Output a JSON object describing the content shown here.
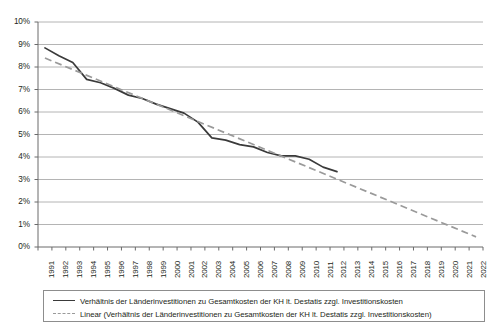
{
  "chart_data": {
    "type": "line",
    "title": "",
    "subtitle": "",
    "xlabel": "",
    "ylabel": "",
    "grid": true,
    "legend_position": "bottom",
    "ylim": [
      0,
      10
    ],
    "ytick_labels": [
      "0%",
      "1%",
      "2%",
      "3%",
      "4%",
      "5%",
      "6%",
      "7%",
      "8%",
      "9%",
      "10%"
    ],
    "ytick_values": [
      0,
      1,
      2,
      3,
      4,
      5,
      6,
      7,
      8,
      9,
      10
    ],
    "categories": [
      "1991",
      "1992",
      "1993",
      "1994",
      "1995",
      "1996",
      "1997",
      "1998",
      "1999",
      "2000",
      "2001",
      "2002",
      "2003",
      "2004",
      "2005",
      "2006",
      "2007",
      "2008",
      "2009",
      "2010",
      "2011",
      "2012",
      "2013",
      "2014",
      "2015",
      "2016",
      "2017",
      "2018",
      "2019",
      "2020",
      "2021",
      "2022"
    ],
    "series": [
      {
        "name": "Verhältnis der Länderinvestitionen zu Gesamtkosten der KH lt. Destatis zzgl. Investitionskosten",
        "style": "solid",
        "color": "#3a3a3a",
        "x": [
          "1991",
          "1992",
          "1993",
          "1994",
          "1995",
          "1996",
          "1997",
          "1998",
          "1999",
          "2000",
          "2001",
          "2002",
          "2003",
          "2004",
          "2005",
          "2006",
          "2007",
          "2008",
          "2009",
          "2010",
          "2011",
          "2012"
        ],
        "values": [
          8.85,
          8.5,
          8.2,
          7.45,
          7.3,
          7.05,
          6.75,
          6.6,
          6.35,
          6.15,
          5.95,
          5.55,
          4.85,
          4.75,
          4.55,
          4.45,
          4.2,
          4.05,
          4.05,
          3.9,
          3.55,
          3.35
        ]
      },
      {
        "name": "Linear (Verhältnis der Länderinvestitionen zu Gesamtkosten der KH lt. Destatis zzgl. Investitionskosten)",
        "style": "dashed",
        "color": "#9a9a9a",
        "x": [
          "1991",
          "2022"
        ],
        "values": [
          8.4,
          0.45
        ]
      }
    ]
  },
  "legend": {
    "entries": [
      {
        "marker": "solid-line",
        "label": "Verhältnis der Länderinvestitionen zu Gesamtkosten der KH lt. Destatis zzgl. Investitionskosten"
      },
      {
        "marker": "dashed-line",
        "label": "Linear (Verhältnis der Länderinvestitionen zu Gesamtkosten der KH lt. Destatis zzgl. Investitionskosten)"
      }
    ]
  },
  "colors": {
    "series_solid": "#3a3a3a",
    "series_trend": "#9a9a9a",
    "gridline": "#b4b4b4",
    "axis": "#6b6b6b",
    "text": "#231f20"
  }
}
